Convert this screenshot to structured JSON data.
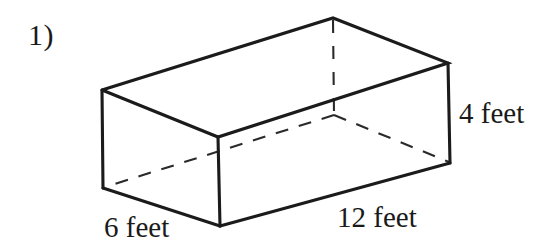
{
  "figure": {
    "item_number": "1)",
    "shape_name": "rectangular-prism",
    "labels": {
      "height": "4 feet",
      "length": "12 feet",
      "width": "6 feet"
    },
    "dimensions": {
      "length_value": 12,
      "width_value": 6,
      "height_value": 4,
      "unit": "feet"
    },
    "colors": {
      "background": "#ffffff",
      "edge": "#1b1b1b",
      "hidden_edge": "#2a2a2a",
      "text": "#1a1a1a"
    },
    "geometry": {
      "front_top_left": [
        102,
        90
      ],
      "front_top_right": [
        218,
        137
      ],
      "back_top_left": [
        333,
        18
      ],
      "back_top_right": [
        448,
        63
      ],
      "front_bottom_left": [
        103,
        188
      ],
      "front_bottom_right": [
        220,
        226
      ],
      "back_bottom_right": [
        450,
        163
      ],
      "hidden_back_bottom": [
        334,
        115
      ]
    }
  }
}
